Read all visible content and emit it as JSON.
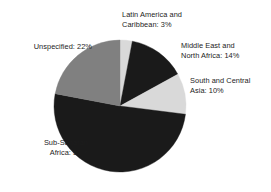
{
  "chart_data": {
    "type": "pie",
    "title": "",
    "subtitle": "",
    "xlabel": "",
    "ylabel": "",
    "legend_position": "none",
    "grid": false,
    "label_format": "{name}: {value}%",
    "start_angle_deg": 0,
    "direction": "clockwise",
    "categories": [
      "Latin America and Caribbean",
      "Middle East and North Africa",
      "South and Central Asia",
      "Sub-Saharan Africa",
      "Unspecified"
    ],
    "values": [
      3,
      14,
      10,
      51,
      22
    ],
    "total": 100,
    "colors": [
      "#d9d9d9",
      "#1a1a1a",
      "#d9d9d9",
      "#1a1a1a",
      "#808080"
    ],
    "slices": [
      {
        "name": "Latin America and Caribbean",
        "value": 3,
        "color": "#d9d9d9",
        "label_line1": "Latin America and",
        "label_line2": "Caribbean: 3%",
        "label_text": "Latin America and\nCaribbean: 3%"
      },
      {
        "name": "Middle East and North Africa",
        "value": 14,
        "color": "#1a1a1a",
        "label_line1": "Middle East and",
        "label_line2": "North Africa: 14%",
        "label_text": "Middle East and\nNorth Africa: 14%"
      },
      {
        "name": "South and Central Asia",
        "value": 10,
        "color": "#d9d9d9",
        "label_line1": "South and Central",
        "label_line2": "Asia: 10%",
        "label_text": "South and Central\nAsia: 10%"
      },
      {
        "name": "Sub-Saharan Africa",
        "value": 51,
        "color": "#1a1a1a",
        "label_line1": "Sub-Saharan",
        "label_line2": "Africa: 51%",
        "label_text": "Sub-Saharan\nAfrica: 51%"
      },
      {
        "name": "Unspecified",
        "value": 22,
        "color": "#808080",
        "label_line1": "Unspecified: 22%",
        "label_line2": "",
        "label_text": "Unspecified: 22%"
      }
    ]
  },
  "geometry": {
    "center_x": 120,
    "center_y": 106,
    "radius": 66
  },
  "palette": {
    "dark": "#1a1a1a",
    "medium_gray": "#808080",
    "light_gray": "#d9d9d9",
    "background": "#ffffff",
    "text": "#1c1c1c"
  }
}
